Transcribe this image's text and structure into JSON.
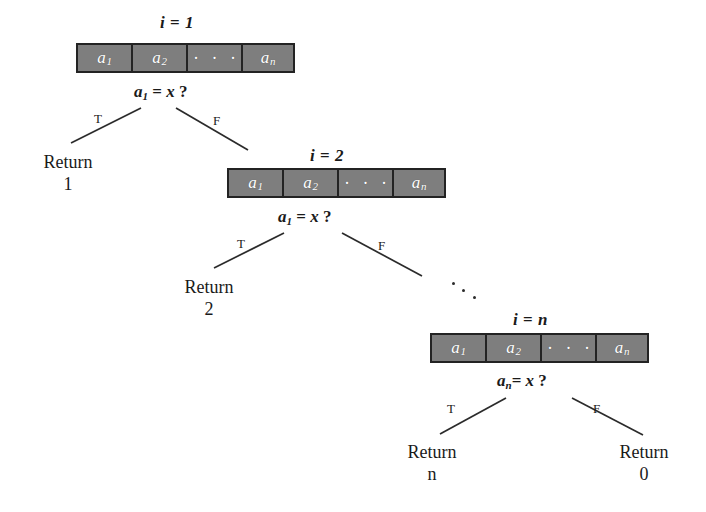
{
  "figure": {
    "background": "#ffffff",
    "box_fill": "#7e7e7e",
    "box_border": "#232323",
    "line_color": "#2b2b2b",
    "text_color": "#1a1a1a"
  },
  "nodes": [
    {
      "id": "node-1",
      "iteration_label": "i = 1",
      "iteration_var": "i",
      "iteration_value": "1",
      "condition": "a1 = x ?",
      "condition_base": "a",
      "condition_sub": "1",
      "condition_rest": "= x ?",
      "array": {
        "cells": [
          {
            "base": "a",
            "sub": "1"
          },
          {
            "base": "a",
            "sub": "2"
          },
          {
            "base": "· · ·",
            "sub": ""
          },
          {
            "base": "a",
            "sub": "n"
          }
        ]
      },
      "branches": [
        {
          "label": "T",
          "target": "Return 1"
        },
        {
          "label": "F",
          "target": "node-2"
        }
      ]
    },
    {
      "id": "node-2",
      "iteration_label": "i = 2",
      "iteration_var": "i",
      "iteration_value": "2",
      "condition": "a1 = x ?",
      "condition_base": "a",
      "condition_sub": "1",
      "condition_rest": "= x ?",
      "array": {
        "cells": [
          {
            "base": "a",
            "sub": "1"
          },
          {
            "base": "a",
            "sub": "2"
          },
          {
            "base": "· · ·",
            "sub": ""
          },
          {
            "base": "a",
            "sub": "n"
          }
        ]
      },
      "branches": [
        {
          "label": "T",
          "target": "Return 2"
        },
        {
          "label": "F",
          "target": "node-n"
        }
      ]
    },
    {
      "id": "node-n",
      "iteration_label": "i = n",
      "iteration_var": "i",
      "iteration_value": "n",
      "condition": "an = x ?",
      "condition_base": "a",
      "condition_sub": "n",
      "condition_rest": "= x ?",
      "array": {
        "cells": [
          {
            "base": "a",
            "sub": "1"
          },
          {
            "base": "a",
            "sub": "2"
          },
          {
            "base": "· · ·",
            "sub": ""
          },
          {
            "base": "a",
            "sub": "n"
          }
        ]
      },
      "branches": [
        {
          "label": "T",
          "target": "Return n"
        },
        {
          "label": "F",
          "target": "Return 0"
        }
      ]
    }
  ],
  "leaves": [
    {
      "id": "leaf-1",
      "word": "Return",
      "value": "1"
    },
    {
      "id": "leaf-2",
      "word": "Return",
      "value": "2"
    },
    {
      "id": "leaf-n",
      "word": "Return",
      "value": "n"
    },
    {
      "id": "leaf-0",
      "word": "Return",
      "value": "0"
    }
  ],
  "branch_labels": {
    "true": "T",
    "false": "F"
  },
  "ellipsis": {
    "continuation": "· · ·",
    "cell_dots": "· · ·"
  }
}
